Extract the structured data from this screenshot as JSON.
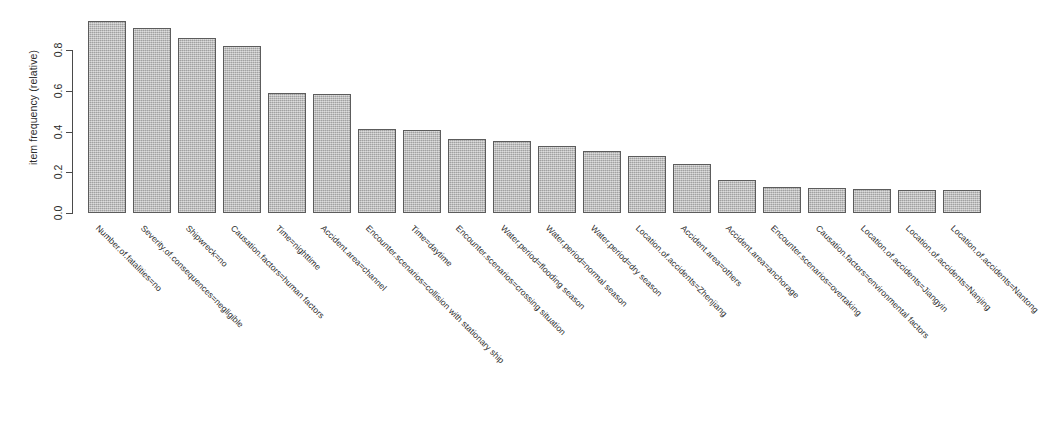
{
  "chart_data": {
    "type": "bar",
    "title": "",
    "xlabel": "",
    "ylabel": "item frequency (relative)",
    "ylim": [
      0.0,
      0.95
    ],
    "grid": false,
    "legend": null,
    "ytick_labels": [
      "0.0",
      "0.2",
      "0.4",
      "0.6",
      "0.8"
    ],
    "ytick_values": [
      0.0,
      0.2,
      0.4,
      0.6,
      0.8
    ],
    "categories": [
      "Number.of.fatalities=no",
      "Severity.of.consequences=negligible",
      "Shipwreck=no",
      "Causation.factors=human factors",
      "Time=nighttime",
      "Accident.area=channel",
      "Encounter.scenarios=collision with stationary ship",
      "Time=daytime",
      "Encounter.scenarios=crossing situation",
      "Water.period=flooding season",
      "Water.period=normal season",
      "Water.period=dry season",
      "Location.of.accidents=Zhenjiang",
      "Accident.area=others",
      "Accident.area=anchorage",
      "Encounter.scenarios=overtaking",
      "Causation.factors=environmental factors",
      "Location.of.accidents=Jiangyin",
      "Location.of.accidents=Nanjing",
      "Location.of.accidents=Nantong"
    ],
    "values": [
      0.94,
      0.91,
      0.86,
      0.82,
      0.59,
      0.585,
      0.41,
      0.405,
      0.365,
      0.355,
      0.33,
      0.305,
      0.28,
      0.24,
      0.16,
      0.13,
      0.125,
      0.12,
      0.115,
      0.112
    ]
  },
  "colors": {
    "bar_fill": "#b4b4b4",
    "bar_border": "#5c5c5c",
    "axis": "#4a4a4a",
    "text": "#2b2b2b",
    "background": "#ffffff"
  }
}
